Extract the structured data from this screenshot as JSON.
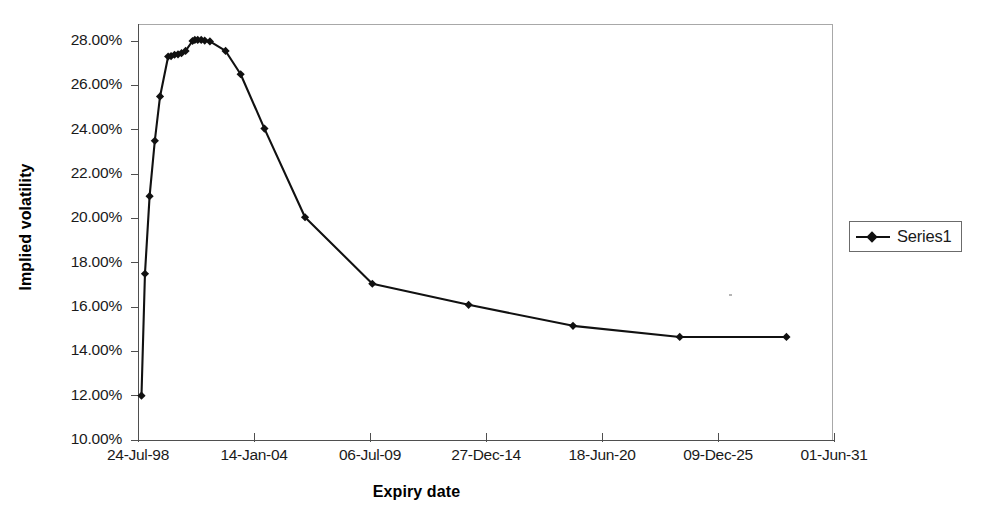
{
  "chart_data": {
    "type": "line",
    "title": "",
    "xlabel": "Expiry date",
    "ylabel": "Implied volatility",
    "legend": {
      "position": "right",
      "entries": [
        "Series1"
      ]
    },
    "grid": false,
    "ylim": [
      10.0,
      28.0
    ],
    "y_tick_labels": [
      "28.00%",
      "26.00%",
      "24.00%",
      "22.00%",
      "20.00%",
      "18.00%",
      "16.00%",
      "14.00%",
      "12.00%",
      "10.00%"
    ],
    "y_tick_values": [
      28.0,
      26.0,
      24.0,
      22.0,
      20.0,
      18.0,
      16.0,
      14.0,
      12.0,
      10.0
    ],
    "x_tick_labels": [
      "24-Jul-98",
      "14-Jan-04",
      "06-Jul-09",
      "27-Dec-14",
      "18-Jun-20",
      "09-Dec-25",
      "01-Jun-31"
    ],
    "x_tick_positions": [
      0,
      1,
      2,
      3,
      4,
      5,
      6
    ],
    "xlim": [
      0,
      6
    ],
    "series": [
      {
        "name": "Series1",
        "marker": "diamond",
        "color": "#111111",
        "x": [
          0.03,
          0.06,
          0.1,
          0.145,
          0.19,
          0.26,
          0.285,
          0.315,
          0.345,
          0.375,
          0.41,
          0.47,
          0.49,
          0.515,
          0.545,
          0.575,
          0.62,
          0.755,
          0.885,
          1.09,
          1.44,
          2.02,
          2.85,
          3.75,
          4.67,
          5.59
        ],
        "y": [
          12.0,
          17.5,
          21.0,
          23.5,
          25.5,
          27.3,
          27.32,
          27.38,
          27.4,
          27.45,
          27.55,
          28.0,
          28.05,
          28.05,
          28.05,
          28.02,
          27.98,
          27.55,
          26.5,
          24.05,
          20.05,
          17.05,
          16.1,
          15.15,
          14.65,
          14.65
        ],
        "values_readable": [
          12.0,
          17.5,
          21.0,
          23.5,
          25.5,
          27.3,
          27.3,
          27.4,
          27.4,
          27.5,
          27.6,
          28.0,
          28.1,
          28.1,
          28.1,
          28.0,
          28.0,
          27.6,
          26.5,
          24.0,
          20.0,
          17.1,
          16.1,
          15.2,
          14.7,
          14.7
        ]
      }
    ]
  },
  "axes": {
    "x_title": "Expiry date",
    "y_title": "Implied volatility"
  },
  "legend": {
    "series1_label": "Series1"
  }
}
